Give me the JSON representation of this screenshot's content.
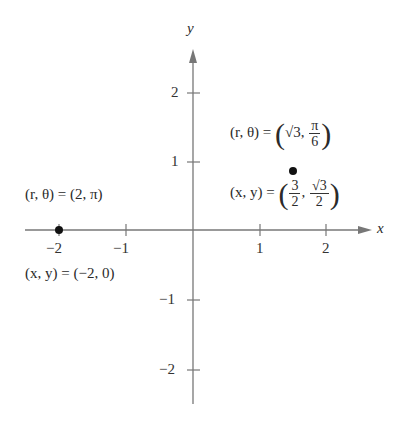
{
  "diagram": {
    "type": "coordinate-plane",
    "axes": {
      "x_label": "x",
      "y_label": "y",
      "x_ticks": [
        {
          "label": "−2",
          "value": -2
        },
        {
          "label": "−1",
          "value": -1
        },
        {
          "label": "1",
          "value": 1
        },
        {
          "label": "2",
          "value": 2
        }
      ],
      "y_ticks": [
        {
          "label": "2",
          "value": 2
        },
        {
          "label": "1",
          "value": 1
        },
        {
          "label": "−1",
          "value": -1
        },
        {
          "label": "−2",
          "value": -2
        }
      ],
      "axis_color": "#777777"
    },
    "points": [
      {
        "id": "point-a",
        "polar_label": "(r, θ) = (2, π)",
        "rect_label": "(x, y) = (−2, 0)",
        "x": -2,
        "y": 0
      },
      {
        "id": "point-b",
        "polar_prefix": "(r, θ) = ",
        "polar_r": "√3",
        "polar_theta_num": "π",
        "polar_theta_den": "6",
        "rect_prefix": "(x, y) = ",
        "rect_x_num": "3",
        "rect_x_den": "2",
        "rect_y_num": "√3",
        "rect_y_den": "2",
        "x": 1.5,
        "y": 0.866
      }
    ],
    "point_color": "#111111"
  }
}
